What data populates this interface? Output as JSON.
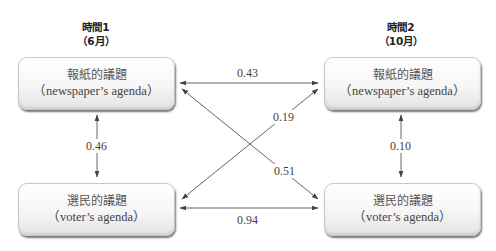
{
  "time_points": [
    {
      "title": "時間1",
      "subtitle": "（6月）"
    },
    {
      "title": "時間2",
      "subtitle": "（10月）"
    }
  ],
  "nodes": {
    "t1_newspaper": {
      "zh": "報紙的議題",
      "en": "（newspaper’s agenda）"
    },
    "t1_voter": {
      "zh": "選民的議題",
      "en": "（voter’s agenda）"
    },
    "t2_newspaper": {
      "zh": "報紙的議題",
      "en": "（newspaper’s agenda）"
    },
    "t2_voter": {
      "zh": "選民的議題",
      "en": "（voter’s agenda）"
    }
  },
  "edges": [
    {
      "from": "t1_newspaper",
      "to": "t2_newspaper",
      "value": "0.43",
      "arrows": "both"
    },
    {
      "from": "t1_newspaper",
      "to": "t1_voter",
      "value": "0.46",
      "arrows": "both"
    },
    {
      "from": "t2_newspaper",
      "to": "t2_voter",
      "value": "0.10",
      "arrows": "both"
    },
    {
      "from": "t1_voter",
      "to": "t2_newspaper",
      "value": "0.19",
      "arrows": "both"
    },
    {
      "from": "t1_newspaper",
      "to": "t2_voter",
      "value": "0.51",
      "arrows": "both"
    },
    {
      "from": "t1_voter",
      "to": "t2_voter",
      "value": "0.94",
      "arrows": "both"
    }
  ],
  "colors": {
    "line": "#555555",
    "node_border": "#c8c8c8",
    "text": "#444444"
  }
}
